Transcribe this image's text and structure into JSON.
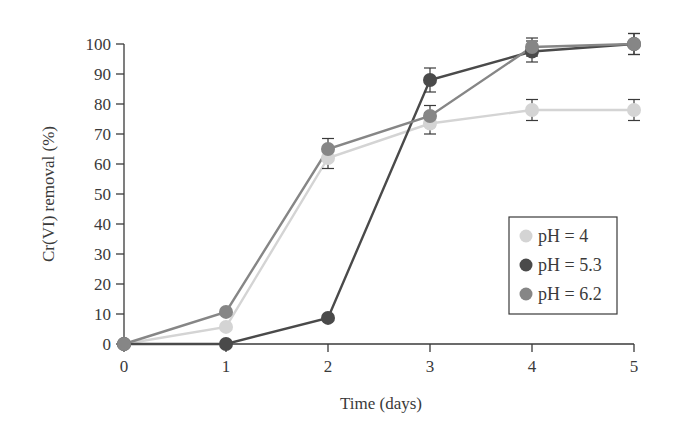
{
  "chart_data": {
    "type": "line",
    "title": "",
    "xlabel": "Time (days)",
    "ylabel": "Cr(VI) removal (%)",
    "x": [
      0,
      1,
      2,
      3,
      4,
      5
    ],
    "xticks": [
      "0",
      "1",
      "2",
      "3",
      "4",
      "5"
    ],
    "yticks": [
      "0",
      "10",
      "20",
      "30",
      "40",
      "50",
      "60",
      "70",
      "80",
      "90",
      "100"
    ],
    "xlim": [
      0,
      5
    ],
    "ylim": [
      0,
      100
    ],
    "grid": false,
    "legend_position": "lower right (inside)",
    "error_bars": true,
    "series": [
      {
        "name": "pH = 4",
        "color": "#d4d4d4",
        "values": [
          0,
          5.7,
          62,
          73.5,
          78,
          78
        ],
        "errors": [
          0,
          0,
          3.5,
          3.5,
          3.5,
          3.5
        ]
      },
      {
        "name": "pH = 5.3",
        "color": "#4a4a4a",
        "values": [
          0,
          0,
          8.7,
          88,
          97.5,
          100
        ],
        "errors": [
          0,
          0,
          0,
          4,
          3.5,
          3.5
        ]
      },
      {
        "name": "pH = 6.2",
        "color": "#868686",
        "values": [
          0,
          10.7,
          65,
          76,
          99,
          100
        ],
        "errors": [
          0,
          0,
          3.5,
          3.5,
          3,
          3.5
        ]
      }
    ]
  }
}
